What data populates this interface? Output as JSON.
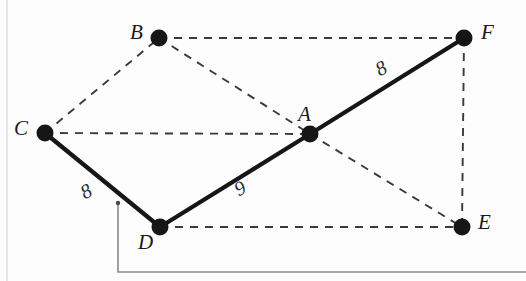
{
  "figure": {
    "width": 526,
    "height": 281,
    "background_color": "#fdfdfd",
    "solid_edge_color": "#161616",
    "dashed_edge_color": "#3a3a3a",
    "vertex_color": "#161616",
    "artifact_color": "#8a8a8a",
    "vertices": [
      {
        "id": "A",
        "label": "A",
        "x": 310,
        "y": 134,
        "r": 8.5,
        "label_x": 298,
        "label_y": 104
      },
      {
        "id": "B",
        "label": "B",
        "x": 159,
        "y": 38,
        "r": 8.5,
        "label_x": 130,
        "label_y": 22
      },
      {
        "id": "C",
        "label": "C",
        "x": 45,
        "y": 133,
        "r": 8.5,
        "label_x": 14,
        "label_y": 118
      },
      {
        "id": "D",
        "label": "D",
        "x": 160,
        "y": 227,
        "r": 8.5,
        "label_x": 138,
        "label_y": 232
      },
      {
        "id": "E",
        "label": "E",
        "x": 462,
        "y": 227,
        "r": 8.5,
        "label_x": 478,
        "label_y": 212
      },
      {
        "id": "F",
        "label": "F",
        "x": 464,
        "y": 38,
        "r": 8.5,
        "label_x": 481,
        "label_y": 22
      }
    ],
    "solid_edges": [
      {
        "id": "C-D",
        "from": "C",
        "to": "D",
        "width": 4.2,
        "label": "8",
        "label_x": 81,
        "label_y": 181,
        "label_rotation": -28
      },
      {
        "id": "D-A",
        "from": "D",
        "to": "A",
        "width": 4.2,
        "label": "9",
        "label_x": 235,
        "label_y": 178,
        "label_rotation": -28
      },
      {
        "id": "A-F",
        "from": "A",
        "to": "F",
        "width": 4.2,
        "label": "8",
        "label_x": 376,
        "label_y": 58,
        "label_rotation": -28
      }
    ],
    "dashed_edges": [
      {
        "id": "C-B",
        "from": "C",
        "to": "B"
      },
      {
        "id": "B-F",
        "from": "B",
        "to": "F"
      },
      {
        "id": "C-A",
        "from": "C",
        "to": "A"
      },
      {
        "id": "B-A",
        "from": "B",
        "to": "A"
      },
      {
        "id": "A-E",
        "from": "A",
        "to": "E"
      },
      {
        "id": "F-E",
        "from": "F",
        "to": "E"
      },
      {
        "id": "D-E",
        "from": "D",
        "to": "E"
      }
    ],
    "artifact_lines": [
      {
        "id": "leader-line",
        "points": "118,203 118,272 526,272"
      },
      {
        "id": "page-edge-left",
        "points": "7,0 7,281"
      }
    ],
    "artifact_dots": [
      {
        "id": "leader-dot",
        "x": 118,
        "y": 203,
        "r": 2.2
      }
    ]
  }
}
